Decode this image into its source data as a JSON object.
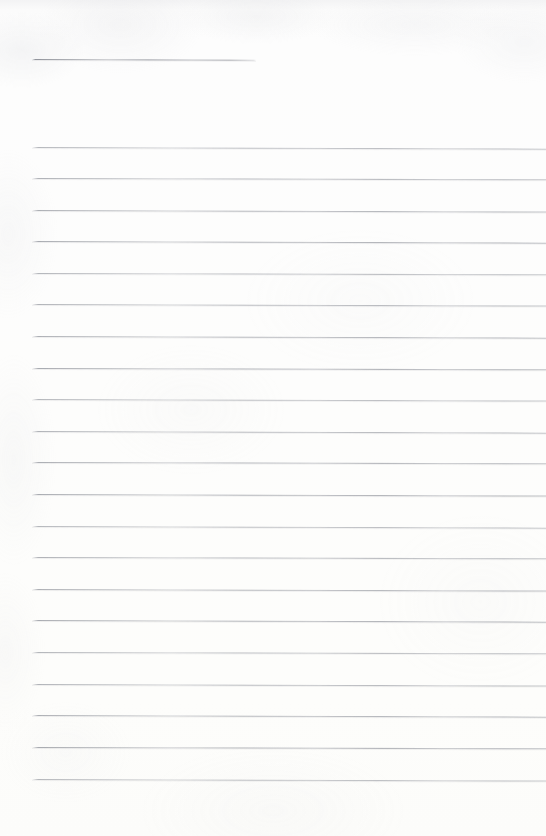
{
  "document": {
    "kind": "lined-notebook-page-scan",
    "title": "Blank ruled notebook page",
    "page_width": 546,
    "page_height": 836,
    "text_content": "",
    "has_handwriting": false,
    "has_printed_text": false,
    "colors": {
      "paper": "#fdfdfc",
      "paper_top_edge": "#f3f3f4",
      "rule_line": "#a0a3aa",
      "rule_line_faint": "#b9bcc0"
    }
  },
  "ruling": {
    "left_margin_x": 32,
    "right_edge_x": 546,
    "line_spacing_px": 31.6,
    "line_thickness_px": 1,
    "slope_deg": 0.17,
    "full_rule_count": 21,
    "header_rule_count": 1,
    "total_rule_count": 22,
    "header_rule": {
      "label": "header-rule",
      "x_start": 32,
      "x_end": 256,
      "y": 59,
      "length": 224
    },
    "full_rules": [
      {
        "label": "rule-1",
        "y": 147
      },
      {
        "label": "rule-2",
        "y": 178
      },
      {
        "label": "rule-3",
        "y": 210
      },
      {
        "label": "rule-4",
        "y": 241
      },
      {
        "label": "rule-5",
        "y": 273
      },
      {
        "label": "rule-6",
        "y": 304
      },
      {
        "label": "rule-7",
        "y": 336
      },
      {
        "label": "rule-8",
        "y": 368
      },
      {
        "label": "rule-9",
        "y": 399
      },
      {
        "label": "rule-10",
        "y": 431
      },
      {
        "label": "rule-11",
        "y": 462
      },
      {
        "label": "rule-12",
        "y": 494
      },
      {
        "label": "rule-13",
        "y": 526
      },
      {
        "label": "rule-14",
        "y": 557
      },
      {
        "label": "rule-15",
        "y": 589
      },
      {
        "label": "rule-16",
        "y": 620
      },
      {
        "label": "rule-17",
        "y": 652
      },
      {
        "label": "rule-18",
        "y": 684
      },
      {
        "label": "rule-19",
        "y": 715
      },
      {
        "label": "rule-20",
        "y": 747
      },
      {
        "label": "rule-21",
        "y": 779
      }
    ]
  }
}
